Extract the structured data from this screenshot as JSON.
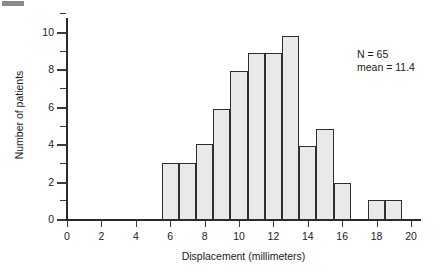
{
  "figure": {
    "background": "#ffffff",
    "corner_mark_color": "#8a8a8a"
  },
  "annotation": {
    "line1": "N = 65",
    "line2": "mean = 11.4"
  },
  "chart_data": {
    "type": "bar",
    "title": "",
    "subtitle": "",
    "xlabel": "Displacement (millimeters)",
    "ylabel": "Number of patients",
    "xlim": [
      -0.45,
      20.8
    ],
    "ylim": [
      0,
      11.0
    ],
    "grid": false,
    "legend": null,
    "bar_style": {
      "fill": "#e9e9e9",
      "edge": "#2f2f2f",
      "bin_width": 1
    },
    "x_ticks_major": [
      0,
      2,
      4,
      6,
      8,
      10,
      12,
      14,
      16,
      18,
      20
    ],
    "x_ticklabels": [
      "0",
      "2",
      "4",
      "6",
      "8",
      "10",
      "12",
      "14",
      "16",
      "18",
      "20"
    ],
    "x_ticks_minor": [
      1,
      3,
      5,
      7,
      9,
      11,
      13,
      15,
      17,
      19
    ],
    "y_ticks_major": [
      0,
      2,
      4,
      6,
      8,
      10
    ],
    "y_ticklabels": [
      "0",
      "2",
      "4",
      "6",
      "8",
      "10"
    ],
    "y_ticks_minor": [
      1,
      3,
      5,
      7,
      9,
      11
    ],
    "bin_edges": [
      5.5,
      6.5,
      7.5,
      8.5,
      9.5,
      10.5,
      11.5,
      12.5,
      13.5,
      14.5,
      15.5,
      16.5,
      17.5,
      18.5,
      19.5
    ],
    "categories": [
      "5.5-6.5",
      "6.5-7.5",
      "7.5-8.5",
      "8.5-9.5",
      "9.5-10.5",
      "10.5-11.5",
      "11.5-12.5",
      "12.5-13.5",
      "13.5-14.5",
      "14.5-15.5",
      "15.5-16.5",
      "16.5-17.5",
      "17.5-18.5",
      "18.5-19.5"
    ],
    "values": [
      3,
      3,
      4,
      5.9,
      7.9,
      8.9,
      8.9,
      9.8,
      3.9,
      4.8,
      1.9,
      0,
      1,
      1
    ],
    "annotations": [
      {
        "text": "N = 65",
        "x": 17.0,
        "y": 9.3
      },
      {
        "text": "mean = 11.4",
        "x": 17.0,
        "y": 8.6
      }
    ],
    "summary": {
      "n": 65,
      "mean": 11.4
    }
  }
}
